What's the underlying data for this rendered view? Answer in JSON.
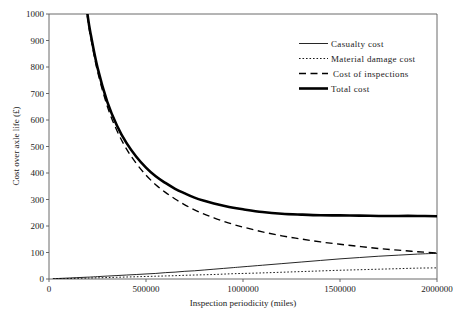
{
  "chart_data": {
    "type": "line",
    "title": "",
    "xlabel": "Inspection periodicity (miles)",
    "ylabel": "Cost over axle life (£)",
    "xlim": [
      0,
      2000000
    ],
    "ylim": [
      0,
      1000
    ],
    "grid": false,
    "legend_position": "top-right",
    "xticks": [
      0,
      500000,
      1000000,
      1500000,
      2000000
    ],
    "xtick_labels": [
      "0",
      "500000",
      "1000000",
      "1500000",
      "2000000"
    ],
    "yticks": [
      0,
      100,
      200,
      300,
      400,
      500,
      600,
      700,
      800,
      900,
      1000
    ],
    "ytick_labels": [
      "0",
      "100",
      "200",
      "300",
      "400",
      "500",
      "600",
      "700",
      "800",
      "900",
      "1000"
    ],
    "x": [
      20000,
      50000,
      80000,
      110000,
      140000,
      170000,
      200000,
      215000,
      250000,
      300000,
      350000,
      400000,
      450000,
      500000,
      550000,
      600000,
      650000,
      700000,
      750000,
      800000,
      850000,
      900000,
      950000,
      1000000,
      1100000,
      1200000,
      1300000,
      1400000,
      1500000,
      1600000,
      1700000,
      1800000,
      1900000,
      2000000
    ],
    "series": [
      {
        "name": "Casualty cost",
        "style": "thin-solid",
        "values": [
          1,
          2,
          3,
          4,
          5,
          6,
          7,
          7.5,
          9,
          11,
          13,
          15,
          17,
          19,
          21,
          24,
          26,
          29,
          31,
          34,
          37,
          40,
          43,
          46,
          52,
          58,
          64,
          70,
          76,
          81,
          86,
          90,
          94,
          97
        ]
      },
      {
        "name": "Material damage cost",
        "style": "dotted",
        "values": [
          0.5,
          1,
          1.5,
          2,
          2.5,
          3,
          3.5,
          3.8,
          4.5,
          5.5,
          6.5,
          7.5,
          8.5,
          9.5,
          10.5,
          11.5,
          12.5,
          14,
          15,
          16,
          17,
          18.5,
          20,
          21,
          23,
          25.5,
          28,
          30.5,
          33,
          35,
          37,
          39,
          41,
          42
        ]
      },
      {
        "name": "Cost of inspections",
        "style": "dashed",
        "values": [
          9800,
          3900,
          2450,
          1780,
          1400,
          1150,
          980,
          912,
          784,
          653,
          560,
          490,
          436,
          392,
          356,
          327,
          302,
          280,
          261,
          245,
          231,
          218,
          206,
          196,
          178,
          163,
          151,
          140,
          131,
          123,
          115,
          109,
          103,
          98
        ]
      },
      {
        "name": "Total cost",
        "style": "thick-solid",
        "values": [
          9801.5,
          3903,
          2454.5,
          1786,
          1407.5,
          1159,
          990.5,
          923.3,
          797.5,
          669.5,
          579.5,
          512.5,
          461.5,
          420.5,
          387.5,
          362.5,
          340.5,
          323,
          307,
          295,
          285,
          276.5,
          269,
          263,
          253,
          246.5,
          243,
          240.5,
          240,
          239,
          238,
          238,
          238,
          237
        ]
      }
    ]
  },
  "legend": {
    "items": [
      {
        "label": "Casualty cost",
        "sample": "thin-solid-sample"
      },
      {
        "label": "Material damage cost",
        "sample": "dotted-sample"
      },
      {
        "label": "Cost of inspections",
        "sample": "dashed-sample"
      },
      {
        "label": "Total cost",
        "sample": "thick-solid-sample"
      }
    ]
  }
}
